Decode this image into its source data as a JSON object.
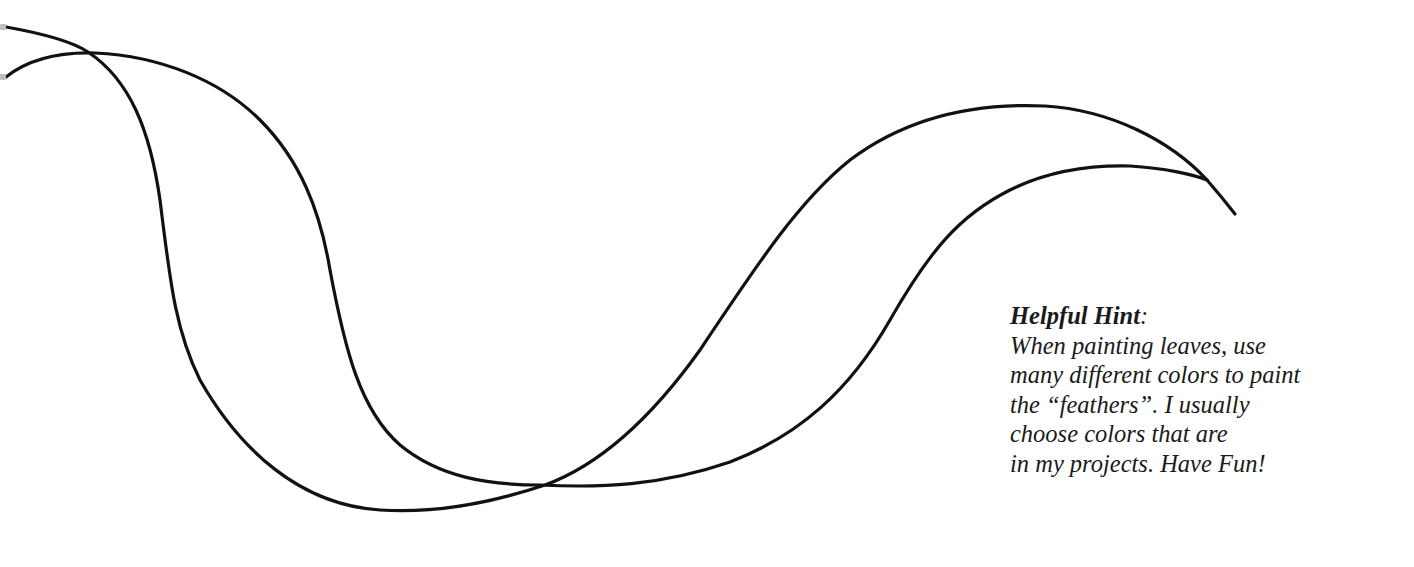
{
  "hint": {
    "title": "Helpful Hint",
    "title_suffix": ":",
    "lines": [
      "When painting leaves, use",
      "many different colors to paint",
      "the “feathers”.  I usually",
      "choose colors that are",
      "in my projects.  Have Fun!"
    ]
  },
  "pattern": {
    "description": "leaf / feather outline pattern",
    "stroke_color": "#111111",
    "background_color": "#ffffff"
  }
}
